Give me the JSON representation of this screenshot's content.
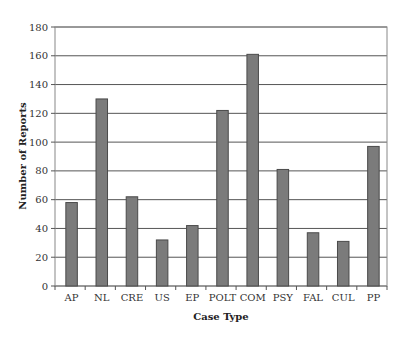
{
  "chart_data": {
    "type": "bar",
    "title": "",
    "xlabel": "Case Type",
    "ylabel": "Number of Reports",
    "categories": [
      "AP",
      "NL",
      "CRE",
      "US",
      "EP",
      "POLT",
      "COM",
      "PSY",
      "FAL",
      "CUL",
      "PP"
    ],
    "values": [
      58,
      130,
      62,
      32,
      42,
      122,
      161,
      81,
      37,
      31,
      97
    ],
    "ylim": [
      0,
      180
    ],
    "yticks": [
      0,
      20,
      40,
      60,
      80,
      100,
      120,
      140,
      160,
      180
    ],
    "grid": true,
    "legend": null,
    "colors": {
      "bar_fill": "#7b7b7b",
      "bar_stroke": "#4a4a4a",
      "grid": "#555555",
      "frame": "#888888"
    }
  }
}
